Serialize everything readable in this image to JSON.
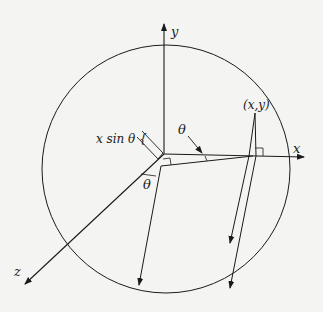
{
  "diagram": {
    "title": "",
    "labels": {
      "y_axis": "y",
      "x_axis": "x",
      "z_axis": "z",
      "point": "(x,y)",
      "offset": "x sin θ {",
      "theta_upper": "θ",
      "theta_lower": "θ"
    },
    "colors": {
      "ink": "#1a1a1a",
      "background": "#f4f4f2"
    }
  }
}
